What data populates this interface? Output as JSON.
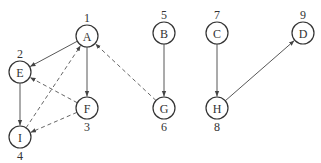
{
  "diagram": {
    "type": "directed-graph-dfs",
    "nodes": [
      {
        "id": "A",
        "label": "A",
        "order": "1",
        "x": 87,
        "y": 36,
        "order_pos": "above"
      },
      {
        "id": "E",
        "label": "E",
        "order": "2",
        "x": 20,
        "y": 72,
        "order_pos": "above"
      },
      {
        "id": "F",
        "label": "F",
        "order": "3",
        "x": 87,
        "y": 108,
        "order_pos": "below"
      },
      {
        "id": "I",
        "label": "I",
        "order": "4",
        "x": 20,
        "y": 137,
        "order_pos": "below"
      },
      {
        "id": "B",
        "label": "B",
        "order": "5",
        "x": 164,
        "y": 33,
        "order_pos": "above"
      },
      {
        "id": "G",
        "label": "G",
        "order": "6",
        "x": 164,
        "y": 108,
        "order_pos": "below"
      },
      {
        "id": "C",
        "label": "C",
        "order": "7",
        "x": 217,
        "y": 33,
        "order_pos": "above"
      },
      {
        "id": "H",
        "label": "H",
        "order": "8",
        "x": 217,
        "y": 108,
        "order_pos": "below"
      },
      {
        "id": "D",
        "label": "D",
        "order": "9",
        "x": 303,
        "y": 33,
        "order_pos": "above"
      }
    ],
    "edges": [
      {
        "from": "A",
        "to": "E",
        "style": "solid"
      },
      {
        "from": "A",
        "to": "F",
        "style": "solid"
      },
      {
        "from": "E",
        "to": "I",
        "style": "solid"
      },
      {
        "from": "B",
        "to": "G",
        "style": "solid"
      },
      {
        "from": "C",
        "to": "H",
        "style": "solid"
      },
      {
        "from": "H",
        "to": "D",
        "style": "solid"
      },
      {
        "from": "I",
        "to": "A",
        "style": "dashed"
      },
      {
        "from": "F",
        "to": "E",
        "style": "dashed"
      },
      {
        "from": "F",
        "to": "I",
        "style": "dashed"
      },
      {
        "from": "G",
        "to": "A",
        "style": "dashed"
      }
    ],
    "node_radius": 11,
    "colors": {
      "stroke": "#333333",
      "background": "#ffffff"
    }
  }
}
